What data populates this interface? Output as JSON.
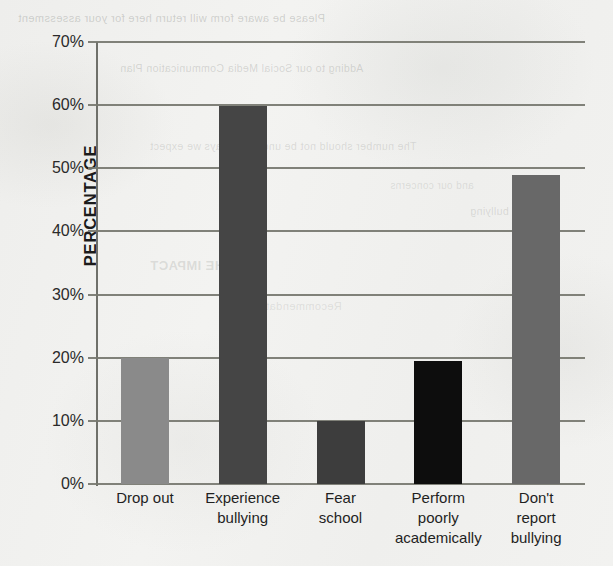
{
  "chart_data": {
    "type": "bar",
    "title": "",
    "xlabel": "",
    "ylabel": "PERCENTAGE",
    "categories": [
      "Drop out",
      "Experience bullying",
      "Fear school",
      "Perform poorly academically",
      "Don't report bullying"
    ],
    "category_lines": [
      [
        "Drop out"
      ],
      [
        "Experience",
        "bullying"
      ],
      [
        "Fear",
        "school"
      ],
      [
        "Perform",
        "poorly",
        "academically"
      ],
      [
        "Don't",
        "report",
        "bullying"
      ]
    ],
    "values": [
      20,
      59.8,
      10,
      19.5,
      49
    ],
    "value_labels": [
      "20%",
      "60%",
      "10%",
      "19.5%",
      "49%"
    ],
    "ylim": [
      0,
      70
    ],
    "ytick_values": [
      0,
      10,
      20,
      30,
      40,
      50,
      60,
      70
    ],
    "ytick_labels": [
      "0%",
      "10%",
      "20%",
      "30%",
      "40%",
      "50%",
      "60%",
      "70%"
    ],
    "grid": true,
    "legend": "none",
    "bar_colors": [
      "#8a8a8a",
      "#454545",
      "#3d3d3d",
      "#0d0d0d",
      "#686868"
    ],
    "gridline_color": "#76776f",
    "axis_color": "#6f706a",
    "background_color": "#f1f1ef"
  },
  "bleed_through": {
    "note": "faint mirrored show-through text from reverse of the scanned page",
    "lines": [
      "Please be aware form will return here for your assessment",
      "Adding to our Social Media Communication Plan",
      "The number should not be under the ways we expect",
      "and our concerns",
      "bullying",
      "AND THE IMPACT",
      "Recommendation"
    ]
  }
}
